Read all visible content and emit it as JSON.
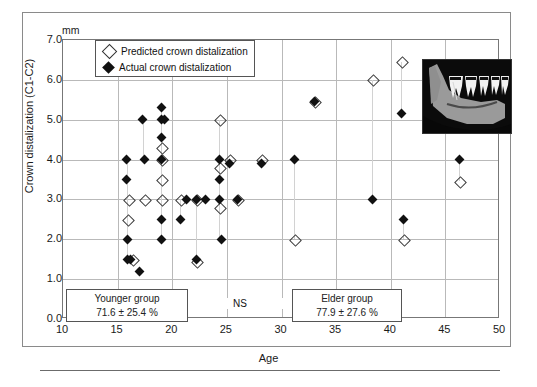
{
  "chart_data": {
    "type": "scatter",
    "title": "",
    "xlabel": "Age",
    "ylabel": "Crown distalization (C1-C2)",
    "yunit": "mm",
    "xlim": [
      10,
      50
    ],
    "ylim": [
      0.0,
      7.0
    ],
    "xticks": [
      10,
      15,
      20,
      25,
      30,
      35,
      40,
      45,
      50
    ],
    "yticks": [
      "0.0",
      "1.0",
      "2.0",
      "3.0",
      "4.0",
      "5.0",
      "6.0",
      "7.0"
    ],
    "grid": "horizontal-and-vertical",
    "legend_position": "top-left-inside",
    "series": [
      {
        "name": "Predicted crown distalization",
        "marker": "open-diamond",
        "color": "#ffffff",
        "edge_color": "#333333",
        "points": [
          {
            "x": 15.9,
            "y": 2.5
          },
          {
            "x": 16.0,
            "y": 3.0
          },
          {
            "x": 16.4,
            "y": 1.5
          },
          {
            "x": 17.5,
            "y": 3.0
          },
          {
            "x": 19.0,
            "y": 4.3
          },
          {
            "x": 19.0,
            "y": 4.0
          },
          {
            "x": 19.0,
            "y": 3.5
          },
          {
            "x": 19.0,
            "y": 3.0
          },
          {
            "x": 20.8,
            "y": 3.0
          },
          {
            "x": 22.2,
            "y": 3.0
          },
          {
            "x": 22.2,
            "y": 1.45
          },
          {
            "x": 24.3,
            "y": 5.0
          },
          {
            "x": 24.3,
            "y": 3.8
          },
          {
            "x": 24.3,
            "y": 2.8
          },
          {
            "x": 25.2,
            "y": 4.0
          },
          {
            "x": 26.0,
            "y": 3.0
          },
          {
            "x": 28.2,
            "y": 4.0
          },
          {
            "x": 31.2,
            "y": 2.0
          },
          {
            "x": 33.0,
            "y": 5.45
          },
          {
            "x": 38.3,
            "y": 6.0
          },
          {
            "x": 41.0,
            "y": 6.45
          },
          {
            "x": 41.2,
            "y": 2.0
          },
          {
            "x": 46.3,
            "y": 3.45
          }
        ]
      },
      {
        "name": "Actual crown distalization",
        "marker": "filled-diamond",
        "color": "#111111",
        "points": [
          {
            "x": 15.8,
            "y": 4.0
          },
          {
            "x": 15.8,
            "y": 3.5
          },
          {
            "x": 15.9,
            "y": 2.0
          },
          {
            "x": 15.9,
            "y": 1.5
          },
          {
            "x": 16.2,
            "y": 1.5
          },
          {
            "x": 17.0,
            "y": 1.2
          },
          {
            "x": 17.3,
            "y": 5.0
          },
          {
            "x": 17.5,
            "y": 4.0
          },
          {
            "x": 19.0,
            "y": 5.3
          },
          {
            "x": 19.0,
            "y": 5.0
          },
          {
            "x": 19.0,
            "y": 4.55
          },
          {
            "x": 19.0,
            "y": 4.0
          },
          {
            "x": 19.3,
            "y": 5.0
          },
          {
            "x": 19.0,
            "y": 2.5
          },
          {
            "x": 19.0,
            "y": 2.0
          },
          {
            "x": 20.8,
            "y": 2.5
          },
          {
            "x": 21.3,
            "y": 3.0
          },
          {
            "x": 22.2,
            "y": 3.0
          },
          {
            "x": 22.2,
            "y": 1.5
          },
          {
            "x": 23.0,
            "y": 3.0
          },
          {
            "x": 24.3,
            "y": 4.0
          },
          {
            "x": 24.3,
            "y": 3.5
          },
          {
            "x": 24.3,
            "y": 3.0
          },
          {
            "x": 24.5,
            "y": 2.0
          },
          {
            "x": 25.2,
            "y": 3.9
          },
          {
            "x": 26.0,
            "y": 3.0
          },
          {
            "x": 28.2,
            "y": 3.9
          },
          {
            "x": 31.2,
            "y": 4.0
          },
          {
            "x": 33.0,
            "y": 5.45
          },
          {
            "x": 38.3,
            "y": 3.0
          },
          {
            "x": 41.0,
            "y": 5.15
          },
          {
            "x": 41.2,
            "y": 2.5
          },
          {
            "x": 46.3,
            "y": 4.0
          }
        ]
      }
    ],
    "pairs": [
      {
        "x": 15.9,
        "y1": 1.5,
        "y2": 4.0
      },
      {
        "x": 17.4,
        "y1": 4.0,
        "y2": 5.0
      },
      {
        "x": 19.0,
        "y1": 2.0,
        "y2": 5.3
      },
      {
        "x": 20.8,
        "y1": 2.5,
        "y2": 3.0
      },
      {
        "x": 22.2,
        "y1": 1.45,
        "y2": 3.0
      },
      {
        "x": 24.3,
        "y1": 2.0,
        "y2": 5.0
      },
      {
        "x": 25.2,
        "y1": 3.9,
        "y2": 4.0
      },
      {
        "x": 26.0,
        "y1": 3.0,
        "y2": 3.0
      },
      {
        "x": 28.2,
        "y1": 3.9,
        "y2": 4.0
      },
      {
        "x": 31.2,
        "y1": 2.0,
        "y2": 4.0
      },
      {
        "x": 38.3,
        "y1": 3.0,
        "y2": 6.0
      },
      {
        "x": 41.0,
        "y1": 5.15,
        "y2": 6.45
      },
      {
        "x": 41.2,
        "y1": 2.0,
        "y2": 2.5
      },
      {
        "x": 46.3,
        "y1": 3.45,
        "y2": 4.0
      }
    ],
    "annotations": {
      "younger_group": {
        "label": "Younger group",
        "value": "71.6 ± 25.4 %"
      },
      "elder_group": {
        "label": "Elder group",
        "value": "77.9 ± 27.6 %"
      },
      "significance": "NS"
    }
  },
  "legend": {
    "items": [
      {
        "label": "Predicted crown distalization",
        "marker": "open-diamond"
      },
      {
        "label": "Actual crown distalization",
        "marker": "filled-diamond"
      }
    ]
  },
  "inset": {
    "name": "mandible-radiograph",
    "description": "Lateral radiograph of mandible with molars and distalizing appliance"
  }
}
